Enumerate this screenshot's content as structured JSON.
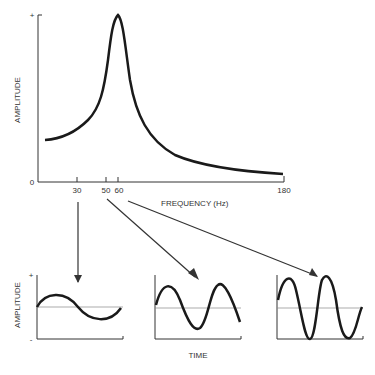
{
  "main_chart": {
    "y_label": "AMPLITUDE",
    "y_top_tick": "+",
    "y_zero_tick": "0",
    "x_label": "FREQUENCY (Hz)",
    "x_ticks": [
      "30",
      "50",
      "60",
      "180"
    ]
  },
  "small_charts": {
    "y_label": "AMPLITUDE",
    "y_plus": "+",
    "y_minus": "-",
    "x_label": "TIME",
    "panels": [
      {
        "frequency": "30",
        "description": "low amplitude, ~1 cycle"
      },
      {
        "frequency": "50",
        "description": "medium amplitude, ~1.7 cycles"
      },
      {
        "frequency": "60",
        "description": "high amplitude (resonance), ~2 cycles"
      }
    ]
  }
}
